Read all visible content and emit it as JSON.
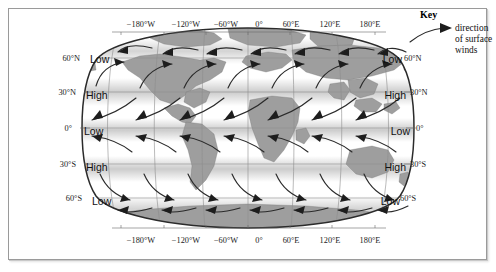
{
  "figure": {
    "type": "map-diagram",
    "projection": "elliptical world projection"
  },
  "key": {
    "title": "Key",
    "icon": "curved-arrow-icon",
    "line1": "direction",
    "line2": "of surface",
    "line3": "winds",
    "full_text": "direction of surface winds"
  },
  "axes": {
    "longitude_top": [
      "−180°W",
      "−120°W",
      "−60°W",
      "0°",
      "60°E",
      "120°E",
      "180°E"
    ],
    "longitude_bottom": [
      "−180°W",
      "−120°W",
      "−60°W",
      "0°",
      "60°E",
      "120°E",
      "180°E"
    ],
    "latitude_left": [
      "60°N",
      "30°N",
      "0°",
      "30°S",
      "60°S"
    ],
    "latitude_right": [
      "60°N",
      "30°N",
      "0°",
      "30°S",
      "60°S"
    ]
  },
  "pressure_belts": {
    "left": [
      "Low",
      "High",
      "Low",
      "High",
      "Low"
    ],
    "right": [
      "Low",
      "High",
      "Low",
      "High",
      "Low"
    ]
  },
  "colors": {
    "land": "#9e9e9e",
    "outline": "#2b2b2b",
    "graticule": "#8d8d8d",
    "arrow": "#2a2a2a",
    "frame": "#9a9a9a",
    "background": "#ffffff"
  }
}
